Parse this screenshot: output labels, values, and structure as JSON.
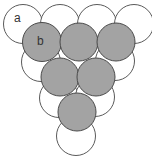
{
  "diagram": {
    "title": "",
    "colors": {
      "background": "#ffffff",
      "white_fill": "#ffffff",
      "white_stroke": "#5a5a5a",
      "gray_fill": "#a3a3a3",
      "gray_stroke": "#4a4a4a"
    },
    "labels": {
      "a": "a",
      "b": "b"
    },
    "white_circles": [
      {
        "cx": 23,
        "cy": 24,
        "r": 19.5
      },
      {
        "cx": 60,
        "cy": 24,
        "r": 19.5
      },
      {
        "cx": 97,
        "cy": 24,
        "r": 19.5
      },
      {
        "cx": 134,
        "cy": 24,
        "r": 19.5
      },
      {
        "cx": 41,
        "cy": 62,
        "r": 19.5
      },
      {
        "cx": 115,
        "cy": 61,
        "r": 19.5
      },
      {
        "cx": 59,
        "cy": 98,
        "r": 19.5
      },
      {
        "cx": 95,
        "cy": 97,
        "r": 19.5
      },
      {
        "cx": 76,
        "cy": 136,
        "r": 19.5
      }
    ],
    "gray_circles": [
      {
        "cx": 42,
        "cy": 42,
        "r": 19.5
      },
      {
        "cx": 79,
        "cy": 42,
        "r": 19
      },
      {
        "cx": 116,
        "cy": 42,
        "r": 19
      },
      {
        "cx": 60,
        "cy": 77,
        "r": 19
      },
      {
        "cx": 96,
        "cy": 77,
        "r": 19
      },
      {
        "cx": 77,
        "cy": 112,
        "r": 19
      }
    ]
  }
}
